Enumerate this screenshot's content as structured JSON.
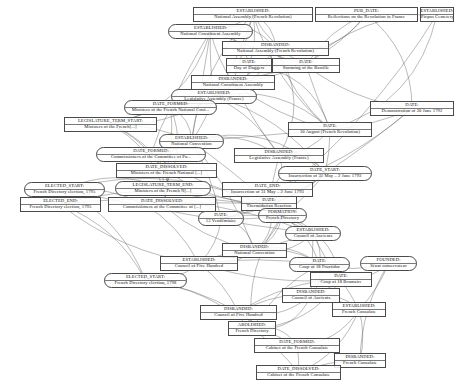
{
  "diagram": {
    "type": "knowledge-graph",
    "nodes": [
      {
        "id": "n1",
        "relation": "ESTABLISHED:",
        "entity": "National Assembly (French Revolution)",
        "x": 193,
        "y": 7,
        "w": 120,
        "h": 15,
        "shape": "rect"
      },
      {
        "id": "n2",
        "relation": "PUB_DATE:",
        "entity": "Reflections on the Revolution in France",
        "x": 315,
        "y": 7,
        "w": 103,
        "h": 15,
        "shape": "rect"
      },
      {
        "id": "n3",
        "relation": "ESTABLISHED:",
        "entity": "Picpus Cemetery",
        "x": 420,
        "y": 7,
        "w": 34,
        "h": 15,
        "shape": "rect"
      },
      {
        "id": "n4",
        "relation": "ESTABLISHED:",
        "entity": "National Constituent Assembly",
        "x": 168,
        "y": 24,
        "w": 85,
        "h": 15,
        "shape": "rounded"
      },
      {
        "id": "n5",
        "relation": "DISBANDED:",
        "entity": "National Assembly (French Revolution)",
        "x": 222,
        "y": 41,
        "w": 107,
        "h": 15,
        "shape": "rect"
      },
      {
        "id": "n6",
        "relation": "DATE:",
        "entity": "Day of Daggers",
        "x": 226,
        "y": 58,
        "w": 46,
        "h": 15,
        "shape": "rect"
      },
      {
        "id": "n7",
        "relation": "DATE:",
        "entity": "Storming of the Bastille",
        "x": 272,
        "y": 58,
        "w": 68,
        "h": 15,
        "shape": "rect"
      },
      {
        "id": "n8",
        "relation": "DISBANDED:",
        "entity": "National Constituent Assembly",
        "x": 191,
        "y": 75,
        "w": 84,
        "h": 15,
        "shape": "rect"
      },
      {
        "id": "n9",
        "relation": "ESTABLISHED:",
        "entity": "Legislative Assembly (France)",
        "x": 171,
        "y": 89,
        "w": 86,
        "h": 15,
        "shape": "rounded"
      },
      {
        "id": "n10",
        "relation": "DATE_FORMED:",
        "entity": "Ministers of the French National Conf...",
        "x": 124,
        "y": 100,
        "w": 93,
        "h": 15,
        "shape": "rounded"
      },
      {
        "id": "n11",
        "relation": "LEGISLATURE_TERM_START:",
        "entity": "Ministers of the French[...]",
        "x": 64,
        "y": 117,
        "w": 93,
        "h": 15,
        "shape": "rect"
      },
      {
        "id": "n12",
        "relation": "DATE:",
        "entity": "10 August (French Revolution)",
        "x": 288,
        "y": 122,
        "w": 84,
        "h": 15,
        "shape": "rect"
      },
      {
        "id": "n13",
        "relation": "DATE:",
        "entity": "Demonstration of 20 June 1792",
        "x": 370,
        "y": 101,
        "w": 84,
        "h": 15,
        "shape": "rect"
      },
      {
        "id": "n14",
        "relation": "ESTABLISHED:",
        "entity": "National Convention",
        "x": 159,
        "y": 134,
        "w": 65,
        "h": 15,
        "shape": "rounded"
      },
      {
        "id": "n15",
        "relation": "DATE_FORMED:",
        "entity": "Commissioners of the Committee of Pu...",
        "x": 96,
        "y": 147,
        "w": 110,
        "h": 15,
        "shape": "rounded"
      },
      {
        "id": "n16",
        "relation": "DISBANDED:",
        "entity": "Legislative Assembly (France)",
        "x": 234,
        "y": 148,
        "w": 90,
        "h": 15,
        "shape": "rect"
      },
      {
        "id": "n17",
        "relation": "DATE_DISSOLVED:",
        "entity": "Ministers of the French National [...]",
        "x": 116,
        "y": 163,
        "w": 101,
        "h": 15,
        "shape": "rect"
      },
      {
        "id": "n18",
        "relation": "DATE_START:",
        "entity": "Insurrection of 31 May – 2 June 1793",
        "x": 278,
        "y": 166,
        "w": 94,
        "h": 15,
        "shape": "rounded"
      },
      {
        "id": "n19",
        "relation": "ELECTED_START:",
        "entity": "French Directory election, 1795",
        "x": 24,
        "y": 182,
        "w": 81,
        "h": 15,
        "shape": "rounded"
      },
      {
        "id": "n20",
        "relation": "LEGISLATURE_TERM_END:",
        "entity": "Ministers of the French N[...]",
        "x": 115,
        "y": 181,
        "w": 96,
        "h": 15,
        "shape": "rounded"
      },
      {
        "id": "n21",
        "relation": "DATE_END:",
        "entity": "Insurrection of 31 May – 2 June 1793",
        "x": 222,
        "y": 182,
        "w": 91,
        "h": 15,
        "shape": "rect"
      },
      {
        "id": "n22",
        "relation": "ELECTED_END:",
        "entity": "French Directory election, 1795",
        "x": 20,
        "y": 197,
        "w": 81,
        "h": 15,
        "shape": "rect"
      },
      {
        "id": "n23",
        "relation": "DATE_DISSOLVED:",
        "entity": "Commissioners of the Committee of [...]",
        "x": 108,
        "y": 197,
        "w": 108,
        "h": 15,
        "shape": "rect"
      },
      {
        "id": "n24",
        "relation": "DATE:",
        "entity": "Thermidorian Reaction",
        "x": 241,
        "y": 196,
        "w": 56,
        "h": 15,
        "shape": "rect"
      },
      {
        "id": "n25",
        "relation": "DATE:",
        "entity": "13 Vendémiaire",
        "x": 198,
        "y": 211,
        "w": 46,
        "h": 15,
        "shape": "rounded"
      },
      {
        "id": "n26",
        "relation": "FORMATION:",
        "entity": "French Directory",
        "x": 258,
        "y": 208,
        "w": 49,
        "h": 15,
        "shape": "rounded"
      },
      {
        "id": "n27",
        "relation": "ESTABLISHED:",
        "entity": "Council of Ancients",
        "x": 285,
        "y": 226,
        "w": 56,
        "h": 15,
        "shape": "rounded"
      },
      {
        "id": "n28",
        "relation": "DISBANDED:",
        "entity": "National Convention",
        "x": 222,
        "y": 243,
        "w": 65,
        "h": 15,
        "shape": "rect"
      },
      {
        "id": "n29",
        "relation": "ESTABLISHED:",
        "entity": "Council of Five Hundred",
        "x": 160,
        "y": 256,
        "w": 78,
        "h": 15,
        "shape": "rect"
      },
      {
        "id": "n30",
        "relation": "DATE:",
        "entity": "Coup of 18 Fructidor",
        "x": 289,
        "y": 257,
        "w": 61,
        "h": 15,
        "shape": "rounded"
      },
      {
        "id": "n31",
        "relation": "FOUNDED:",
        "entity": "Sénat conservateur",
        "x": 360,
        "y": 256,
        "w": 57,
        "h": 15,
        "shape": "rounded"
      },
      {
        "id": "n32",
        "relation": "ELECTED_START:",
        "entity": "French Directory election, 1798",
        "x": 104,
        "y": 273,
        "w": 83,
        "h": 15,
        "shape": "rounded"
      },
      {
        "id": "n33",
        "relation": "DATE:",
        "entity": "Coup of 18 Brumaire",
        "x": 310,
        "y": 272,
        "w": 62,
        "h": 15,
        "shape": "rect"
      },
      {
        "id": "n34",
        "relation": "DISBANDED:",
        "entity": "Council of Ancients",
        "x": 282,
        "y": 288,
        "w": 58,
        "h": 15,
        "shape": "rect"
      },
      {
        "id": "n35",
        "relation": "DISBANDED:",
        "entity": "Council of Five Hundred",
        "x": 200,
        "y": 305,
        "w": 77,
        "h": 15,
        "shape": "rect"
      },
      {
        "id": "n36",
        "relation": "ESTABLISHED:",
        "entity": "French Consulate",
        "x": 332,
        "y": 302,
        "w": 54,
        "h": 15,
        "shape": "rect"
      },
      {
        "id": "n37",
        "relation": "ABOLISHED:",
        "entity": "French Directory",
        "x": 228,
        "y": 321,
        "w": 48,
        "h": 15,
        "shape": "rect"
      },
      {
        "id": "n38",
        "relation": "DATE_FORMED:",
        "entity": "Cabinet of the French Consulate",
        "x": 254,
        "y": 338,
        "w": 86,
        "h": 15,
        "shape": "rect"
      },
      {
        "id": "n39",
        "relation": "DISBANDED:",
        "entity": "French Consulate",
        "x": 334,
        "y": 353,
        "w": 52,
        "h": 15,
        "shape": "rect"
      },
      {
        "id": "n40",
        "relation": "DATE_DISSOLVED:",
        "entity": "Cabinet of the French Consulate",
        "x": 256,
        "y": 365,
        "w": 85,
        "h": 15,
        "shape": "rect"
      }
    ],
    "edges": [
      {
        "from": "n1",
        "to": "n4"
      },
      {
        "from": "n1",
        "to": "n5"
      },
      {
        "from": "n1",
        "to": "n6"
      },
      {
        "from": "n1",
        "to": "n7"
      },
      {
        "from": "n1",
        "to": "n8"
      },
      {
        "from": "n1",
        "to": "n9"
      },
      {
        "from": "n1",
        "to": "n12"
      },
      {
        "from": "n1",
        "to": "n14"
      },
      {
        "from": "n2",
        "to": "n5"
      },
      {
        "from": "n2",
        "to": "n7"
      },
      {
        "from": "n2",
        "to": "n8"
      },
      {
        "from": "n2",
        "to": "n13"
      },
      {
        "from": "n3",
        "to": "n7"
      },
      {
        "from": "n3",
        "to": "n12"
      },
      {
        "from": "n3",
        "to": "n24"
      },
      {
        "from": "n4",
        "to": "n5"
      },
      {
        "from": "n4",
        "to": "n6"
      },
      {
        "from": "n4",
        "to": "n7"
      },
      {
        "from": "n4",
        "to": "n8"
      },
      {
        "from": "n4",
        "to": "n9"
      },
      {
        "from": "n4",
        "to": "n10"
      },
      {
        "from": "n4",
        "to": "n11"
      },
      {
        "from": "n4",
        "to": "n14"
      },
      {
        "from": "n5",
        "to": "n8"
      },
      {
        "from": "n5",
        "to": "n9"
      },
      {
        "from": "n5",
        "to": "n12"
      },
      {
        "from": "n5",
        "to": "n16"
      },
      {
        "from": "n6",
        "to": "n7"
      },
      {
        "from": "n6",
        "to": "n8"
      },
      {
        "from": "n6",
        "to": "n12"
      },
      {
        "from": "n7",
        "to": "n8"
      },
      {
        "from": "n7",
        "to": "n12"
      },
      {
        "from": "n7",
        "to": "n13"
      },
      {
        "from": "n8",
        "to": "n9"
      },
      {
        "from": "n8",
        "to": "n12"
      },
      {
        "from": "n8",
        "to": "n16"
      },
      {
        "from": "n9",
        "to": "n10"
      },
      {
        "from": "n9",
        "to": "n11"
      },
      {
        "from": "n9",
        "to": "n12"
      },
      {
        "from": "n9",
        "to": "n14"
      },
      {
        "from": "n9",
        "to": "n16"
      },
      {
        "from": "n9",
        "to": "n18"
      },
      {
        "from": "n10",
        "to": "n11"
      },
      {
        "from": "n10",
        "to": "n14"
      },
      {
        "from": "n10",
        "to": "n15"
      },
      {
        "from": "n10",
        "to": "n17"
      },
      {
        "from": "n10",
        "to": "n20"
      },
      {
        "from": "n11",
        "to": "n14"
      },
      {
        "from": "n11",
        "to": "n15"
      },
      {
        "from": "n11",
        "to": "n17"
      },
      {
        "from": "n11",
        "to": "n20"
      },
      {
        "from": "n12",
        "to": "n13"
      },
      {
        "from": "n12",
        "to": "n14"
      },
      {
        "from": "n12",
        "to": "n16"
      },
      {
        "from": "n12",
        "to": "n18"
      },
      {
        "from": "n13",
        "to": "n18"
      },
      {
        "from": "n13",
        "to": "n21"
      },
      {
        "from": "n14",
        "to": "n15"
      },
      {
        "from": "n14",
        "to": "n16"
      },
      {
        "from": "n14",
        "to": "n18"
      },
      {
        "from": "n14",
        "to": "n24"
      },
      {
        "from": "n14",
        "to": "n25"
      },
      {
        "from": "n14",
        "to": "n28"
      },
      {
        "from": "n15",
        "to": "n17"
      },
      {
        "from": "n15",
        "to": "n20"
      },
      {
        "from": "n15",
        "to": "n23"
      },
      {
        "from": "n15",
        "to": "n24"
      },
      {
        "from": "n16",
        "to": "n18"
      },
      {
        "from": "n16",
        "to": "n21"
      },
      {
        "from": "n16",
        "to": "n24"
      },
      {
        "from": "n17",
        "to": "n20"
      },
      {
        "from": "n17",
        "to": "n23"
      },
      {
        "from": "n17",
        "to": "n24"
      },
      {
        "from": "n18",
        "to": "n21"
      },
      {
        "from": "n18",
        "to": "n24"
      },
      {
        "from": "n18",
        "to": "n25"
      },
      {
        "from": "n18",
        "to": "n26"
      },
      {
        "from": "n19",
        "to": "n22"
      },
      {
        "from": "n19",
        "to": "n20"
      },
      {
        "from": "n19",
        "to": "n26"
      },
      {
        "from": "n19",
        "to": "n27"
      },
      {
        "from": "n19",
        "to": "n29"
      },
      {
        "from": "n19",
        "to": "n32"
      },
      {
        "from": "n20",
        "to": "n23"
      },
      {
        "from": "n20",
        "to": "n24"
      },
      {
        "from": "n21",
        "to": "n24"
      },
      {
        "from": "n21",
        "to": "n25"
      },
      {
        "from": "n21",
        "to": "n26"
      },
      {
        "from": "n22",
        "to": "n26"
      },
      {
        "from": "n22",
        "to": "n27"
      },
      {
        "from": "n22",
        "to": "n29"
      },
      {
        "from": "n22",
        "to": "n32"
      },
      {
        "from": "n23",
        "to": "n24"
      },
      {
        "from": "n23",
        "to": "n25"
      },
      {
        "from": "n23",
        "to": "n28"
      },
      {
        "from": "n24",
        "to": "n25"
      },
      {
        "from": "n24",
        "to": "n26"
      },
      {
        "from": "n24",
        "to": "n28"
      },
      {
        "from": "n25",
        "to": "n26"
      },
      {
        "from": "n25",
        "to": "n27"
      },
      {
        "from": "n25",
        "to": "n28"
      },
      {
        "from": "n25",
        "to": "n29"
      },
      {
        "from": "n26",
        "to": "n27"
      },
      {
        "from": "n26",
        "to": "n28"
      },
      {
        "from": "n26",
        "to": "n29"
      },
      {
        "from": "n26",
        "to": "n30"
      },
      {
        "from": "n26",
        "to": "n33"
      },
      {
        "from": "n26",
        "to": "n37"
      },
      {
        "from": "n27",
        "to": "n28"
      },
      {
        "from": "n27",
        "to": "n29"
      },
      {
        "from": "n27",
        "to": "n30"
      },
      {
        "from": "n27",
        "to": "n33"
      },
      {
        "from": "n27",
        "to": "n34"
      },
      {
        "from": "n28",
        "to": "n29"
      },
      {
        "from": "n28",
        "to": "n30"
      },
      {
        "from": "n28",
        "to": "n33"
      },
      {
        "from": "n29",
        "to": "n30"
      },
      {
        "from": "n29",
        "to": "n32"
      },
      {
        "from": "n29",
        "to": "n33"
      },
      {
        "from": "n29",
        "to": "n35"
      },
      {
        "from": "n30",
        "to": "n31"
      },
      {
        "from": "n30",
        "to": "n33"
      },
      {
        "from": "n30",
        "to": "n34"
      },
      {
        "from": "n30",
        "to": "n37"
      },
      {
        "from": "n31",
        "to": "n33"
      },
      {
        "from": "n31",
        "to": "n36"
      },
      {
        "from": "n31",
        "to": "n39"
      },
      {
        "from": "n32",
        "to": "n35"
      },
      {
        "from": "n32",
        "to": "n37"
      },
      {
        "from": "n33",
        "to": "n34"
      },
      {
        "from": "n33",
        "to": "n35"
      },
      {
        "from": "n33",
        "to": "n36"
      },
      {
        "from": "n33",
        "to": "n37"
      },
      {
        "from": "n34",
        "to": "n35"
      },
      {
        "from": "n34",
        "to": "n36"
      },
      {
        "from": "n34",
        "to": "n37"
      },
      {
        "from": "n35",
        "to": "n36"
      },
      {
        "from": "n35",
        "to": "n37"
      },
      {
        "from": "n35",
        "to": "n38"
      },
      {
        "from": "n36",
        "to": "n38"
      },
      {
        "from": "n36",
        "to": "n39"
      },
      {
        "from": "n36",
        "to": "n40"
      },
      {
        "from": "n37",
        "to": "n38"
      },
      {
        "from": "n37",
        "to": "n40"
      },
      {
        "from": "n38",
        "to": "n39"
      },
      {
        "from": "n38",
        "to": "n40"
      },
      {
        "from": "n39",
        "to": "n40"
      }
    ],
    "colors": {
      "node_border": "#4a4a4a",
      "edge": "#555555",
      "text": "#111111",
      "background": "#ffffff"
    }
  }
}
